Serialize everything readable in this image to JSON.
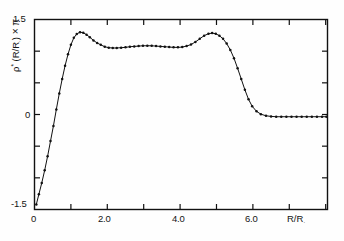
{
  "chart_data": {
    "type": "line",
    "title": "",
    "subtitle": "",
    "xlabel": "R/R☉",
    "ylabel": "ρ* (R/R☉) × π",
    "xlim": [
      0,
      8.05
    ],
    "ylim": [
      -1.5,
      1.5
    ],
    "grid": false,
    "legend": null,
    "marker": "dot",
    "line_color": "#111111",
    "xticks_major": [
      0,
      2.0,
      4.0,
      6.0
    ],
    "xticklabels": [
      "0",
      "2.0",
      "4.0",
      "6.0"
    ],
    "xticks_minor": [
      1.0,
      3.0,
      5.0,
      7.0,
      8.0
    ],
    "yticks_major": [
      -1.5,
      0,
      1.5
    ],
    "yticklabels": [
      "-1.5",
      "0",
      "1.5"
    ],
    "yticks_minor": [
      -1.0,
      -0.5,
      0.5,
      1.0
    ],
    "series": [
      {
        "name": "rho-profile",
        "x": [
          0.05,
          0.12,
          0.2,
          0.28,
          0.36,
          0.44,
          0.52,
          0.6,
          0.68,
          0.76,
          0.84,
          0.92,
          1.0,
          1.08,
          1.16,
          1.25,
          1.34,
          1.43,
          1.52,
          1.62,
          1.72,
          1.82,
          1.93,
          2.04,
          2.15,
          2.26,
          2.38,
          2.5,
          2.62,
          2.74,
          2.86,
          2.98,
          3.1,
          3.22,
          3.34,
          3.46,
          3.58,
          3.7,
          3.82,
          3.94,
          4.06,
          4.18,
          4.3,
          4.42,
          4.54,
          4.66,
          4.78,
          4.88,
          4.98,
          5.08,
          5.18,
          5.28,
          5.38,
          5.48,
          5.58,
          5.68,
          5.78,
          5.88,
          5.98,
          6.1,
          6.22,
          6.36,
          6.5,
          6.64,
          6.78,
          6.92,
          7.06,
          7.2,
          7.34,
          7.48,
          7.62,
          7.76,
          7.9,
          8.02
        ],
        "y": [
          -1.42,
          -1.26,
          -1.08,
          -0.88,
          -0.66,
          -0.42,
          -0.18,
          0.08,
          0.33,
          0.56,
          0.77,
          0.95,
          1.1,
          1.21,
          1.27,
          1.3,
          1.29,
          1.26,
          1.22,
          1.17,
          1.13,
          1.1,
          1.07,
          1.055,
          1.05,
          1.05,
          1.055,
          1.06,
          1.07,
          1.075,
          1.08,
          1.085,
          1.085,
          1.085,
          1.08,
          1.075,
          1.07,
          1.065,
          1.06,
          1.06,
          1.065,
          1.08,
          1.105,
          1.145,
          1.195,
          1.245,
          1.275,
          1.285,
          1.275,
          1.245,
          1.195,
          1.12,
          1.02,
          0.89,
          0.73,
          0.56,
          0.39,
          0.24,
          0.13,
          0.05,
          0.005,
          -0.02,
          -0.03,
          -0.035,
          -0.035,
          -0.035,
          -0.035,
          -0.035,
          -0.035,
          -0.035,
          -0.035,
          -0.035,
          -0.035,
          -0.035
        ]
      }
    ],
    "annotations": []
  },
  "axis": {
    "x_title": "R/R",
    "x_title_sub": ".",
    "y_title_rho": "ρ",
    "y_title_star": "*",
    "y_title_arg": " (R/R",
    "y_title_arg_sub": ".",
    "y_title_arg_end": ")",
    "y_title_times": " × π",
    "xticklabels": [
      "0",
      "2.0",
      "4.0",
      "6.0"
    ],
    "yticklabels": [
      "1.5",
      "0",
      "-1.5"
    ]
  }
}
